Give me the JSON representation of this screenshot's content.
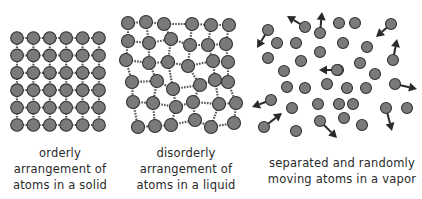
{
  "colors": {
    "atom_fill": "#7a7a7a",
    "atom_stroke": "#333333",
    "bond": "#555555",
    "arrow": "#2a2a2a",
    "text": "#2a2a2a"
  },
  "panels": {
    "solid": {
      "caption_lines": [
        "orderly",
        "arrangement of",
        "atoms in a solid"
      ],
      "grid": {
        "rows": 6,
        "cols": 6,
        "x0": 17,
        "y0": 38,
        "dx": 16.4,
        "dy": 17.4,
        "r": 6.3
      }
    },
    "liquid": {
      "caption_lines": [
        "disorderly",
        "arrangement of",
        "atoms in a liquid"
      ],
      "r": 6.5,
      "atoms": [
        [
          [
            128,
            23
          ],
          [
            146,
            22
          ],
          [
            164,
            24
          ],
          [
            192,
            24
          ],
          [
            211,
            25
          ],
          [
            229,
            25
          ]
        ],
        [
          [
            128,
            41
          ],
          [
            149,
            43
          ],
          [
            171,
            39
          ],
          [
            190,
            45
          ],
          [
            208,
            45
          ],
          [
            226,
            44
          ]
        ],
        [
          [
            126,
            60
          ],
          [
            149,
            63
          ],
          [
            168,
            62
          ],
          [
            188,
            66
          ],
          [
            213,
            61
          ],
          [
            228,
            62
          ]
        ],
        [
          [
            132,
            82
          ],
          [
            157,
            81
          ],
          [
            173,
            89
          ],
          [
            200,
            85
          ],
          [
            215,
            80
          ],
          [
            228,
            82
          ]
        ],
        [
          [
            133,
            102
          ],
          [
            153,
            103
          ],
          [
            176,
            107
          ],
          [
            193,
            102
          ],
          [
            219,
            104
          ],
          [
            236,
            103
          ]
        ],
        [
          [
            138,
            127
          ],
          [
            155,
            126
          ],
          [
            171,
            125
          ],
          [
            195,
            120
          ],
          [
            211,
            127
          ],
          [
            234,
            123
          ]
        ]
      ]
    },
    "vapor": {
      "caption_lines": [
        "separated and randomly",
        "moving atoms in a vapor"
      ],
      "r": 5.5,
      "atoms": [
        [
          268,
          30
        ],
        [
          305,
          27
        ],
        [
          320,
          33
        ],
        [
          339,
          23
        ],
        [
          355,
          23
        ],
        [
          391,
          24
        ],
        [
          277,
          43
        ],
        [
          296,
          43
        ],
        [
          320,
          52
        ],
        [
          343,
          43
        ],
        [
          367,
          47
        ],
        [
          268,
          58
        ],
        [
          301,
          61
        ],
        [
          338,
          70
        ],
        [
          360,
          63
        ],
        [
          393,
          60
        ],
        [
          284,
          71
        ],
        [
          337,
          70
        ],
        [
          375,
          74
        ],
        [
          287,
          87
        ],
        [
          305,
          88
        ],
        [
          327,
          84
        ],
        [
          347,
          88
        ],
        [
          366,
          88
        ],
        [
          395,
          84
        ],
        [
          271,
          100
        ],
        [
          292,
          108
        ],
        [
          318,
          104
        ],
        [
          339,
          104
        ],
        [
          353,
          104
        ],
        [
          386,
          108
        ],
        [
          407,
          108
        ],
        [
          264,
          127
        ],
        [
          296,
          131
        ],
        [
          320,
          121
        ],
        [
          344,
          118
        ],
        [
          362,
          125
        ]
      ],
      "arrows": [
        [
          268,
          30,
          257,
          48
        ],
        [
          305,
          27,
          287,
          16
        ],
        [
          320,
          33,
          322,
          12
        ],
        [
          391,
          24,
          376,
          37
        ],
        [
          393,
          60,
          397,
          39
        ],
        [
          338,
          70,
          319,
          70
        ],
        [
          395,
          84,
          417,
          89
        ],
        [
          271,
          100,
          252,
          107
        ],
        [
          264,
          127,
          282,
          113
        ],
        [
          386,
          108,
          392,
          131
        ],
        [
          320,
          121,
          337,
          138
        ]
      ]
    }
  }
}
